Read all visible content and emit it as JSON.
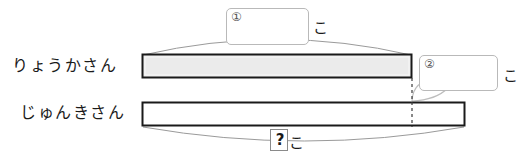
{
  "diagram": {
    "type": "tape-diagram",
    "title": "",
    "rows": [
      {
        "name": "ryouka-row",
        "label": "りょうかさん",
        "bar": {
          "fill_color": "#ebebeb",
          "border_color": "#1a1a1a",
          "x": 142,
          "y": 54,
          "width": 270,
          "height": 24
        },
        "brace": {
          "position": "above",
          "label_box": "①",
          "unit": "こ"
        }
      },
      {
        "name": "junki-row",
        "label": "じゅんきさん",
        "bar": {
          "fill_color": "#ffffff",
          "border_color": "#1a1a1a",
          "x": 142,
          "y": 102,
          "width": 323,
          "height": 24
        },
        "brace": {
          "position": "below",
          "label_box": "?",
          "unit": "こ"
        }
      }
    ],
    "difference": {
      "name": "difference-segment",
      "label_box": "②",
      "unit": "こ",
      "from_x": 412,
      "to_x": 465,
      "divider_style": "dotted"
    },
    "boxes": {
      "box_one": {
        "marker": "①",
        "value": ""
      },
      "box_two": {
        "marker": "②",
        "value": ""
      },
      "unknown": {
        "marker": "?",
        "value": "?"
      }
    },
    "units": {
      "counter": "こ"
    },
    "colors": {
      "bar_stroke": "#1a1a1a",
      "bar_fill_shaded": "#ebebeb",
      "bar_fill_empty": "#ffffff",
      "brace_stroke": "#9a9a9a",
      "box_stroke": "#b9b9b9",
      "text": "#1a1a1a",
      "background": "#ffffff"
    }
  }
}
